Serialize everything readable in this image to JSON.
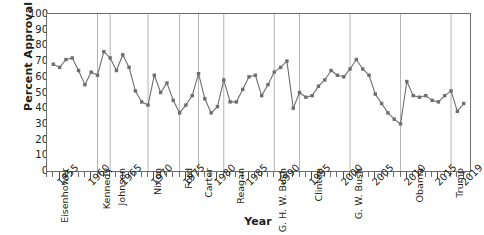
{
  "chart_data": {
    "type": "line",
    "title": "",
    "xlabel": "Year",
    "ylabel": "Percent Approval",
    "xlim": [
      1953,
      2020
    ],
    "ylim": [
      0,
      100
    ],
    "ytick_step": 10,
    "yticks": [
      0,
      10,
      20,
      30,
      40,
      50,
      60,
      70,
      80,
      90,
      100
    ],
    "xticks_major": [
      1955,
      1960,
      1965,
      1970,
      1975,
      1980,
      1985,
      1990,
      1995,
      2000,
      2005,
      2010,
      2015,
      2019
    ],
    "xtick_minor_step": 1,
    "grid": "vertical-term-dividers-only",
    "legend": "none",
    "marker": "square",
    "series_color": "#6d6e70",
    "x": [
      1954,
      1955,
      1956,
      1957,
      1958,
      1959,
      1960,
      1961,
      1962,
      1963,
      1964,
      1965,
      1966,
      1967,
      1968,
      1969,
      1970,
      1971,
      1972,
      1973,
      1974,
      1975,
      1976,
      1977,
      1978,
      1979,
      1980,
      1981,
      1982,
      1983,
      1984,
      1985,
      1986,
      1987,
      1988,
      1989,
      1990,
      1991,
      1992,
      1993,
      1994,
      1995,
      1996,
      1997,
      1998,
      1999,
      2000,
      2001,
      2002,
      2003,
      2004,
      2005,
      2006,
      2007,
      2008,
      2009,
      2010,
      2011,
      2012,
      2013,
      2014,
      2015,
      2016,
      2017,
      2018,
      2019
    ],
    "values": [
      68,
      66,
      71,
      72,
      64,
      55,
      63,
      61,
      76,
      72,
      64,
      74,
      66,
      51,
      44,
      42,
      61,
      50,
      56,
      45,
      37,
      42,
      48,
      62,
      46,
      37,
      41,
      58,
      44,
      44,
      52,
      60,
      61,
      48,
      55,
      63,
      66,
      70,
      40,
      50,
      47,
      48,
      54,
      58,
      64,
      61,
      60,
      65,
      71,
      65,
      61,
      49,
      43,
      37,
      33,
      30,
      57,
      48,
      47,
      48,
      45,
      44,
      48,
      51,
      38,
      43
    ],
    "president_terms": [
      {
        "name": "Eisenhower",
        "start": 1953,
        "end": 1961
      },
      {
        "name": "Kennedy",
        "start": 1961,
        "end": 1963
      },
      {
        "name": "Johnson",
        "start": 1963,
        "end": 1969
      },
      {
        "name": "Nixon",
        "start": 1969,
        "end": 1974
      },
      {
        "name": "Ford",
        "start": 1974,
        "end": 1977
      },
      {
        "name": "Carter",
        "start": 1977,
        "end": 1981
      },
      {
        "name": "Reagan",
        "start": 1981,
        "end": 1989
      },
      {
        "name": "G. H. W. Bush",
        "start": 1989,
        "end": 1993
      },
      {
        "name": "Clinton",
        "start": 1993,
        "end": 2001
      },
      {
        "name": "G. W. Bush",
        "start": 2001,
        "end": 2009
      },
      {
        "name": "Obama",
        "start": 2009,
        "end": 2017
      },
      {
        "name": "Trump",
        "start": 2017,
        "end": 2020
      }
    ]
  },
  "axes": {
    "y_title": "Percent Approval",
    "x_title": "Year"
  },
  "colors": {
    "series": "#6d6e70",
    "axis": "#6d6e70",
    "divider": "#b3b3b3",
    "text": "#231f20",
    "background": "#ffffff"
  }
}
